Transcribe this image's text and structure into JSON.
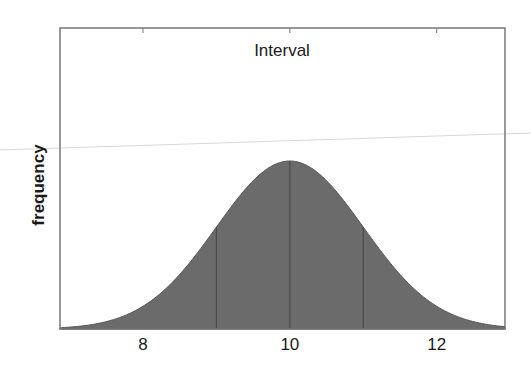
{
  "chart_data": {
    "type": "area",
    "title": "Interval",
    "xlabel": "",
    "ylabel": "frequency",
    "distribution": "normal",
    "mean": 10,
    "std": 1,
    "xlim": [
      6.87,
      12.93
    ],
    "xticks": [
      8,
      10,
      12
    ],
    "xtick_labels": [
      "8",
      "10",
      "12"
    ],
    "yticks": [],
    "vertical_lines_at": [
      9,
      10,
      11
    ],
    "grid": false,
    "legend": null,
    "fill_color": "#6b6b6b",
    "line_color": "#4a4a4a",
    "frame_color": "#777777"
  }
}
